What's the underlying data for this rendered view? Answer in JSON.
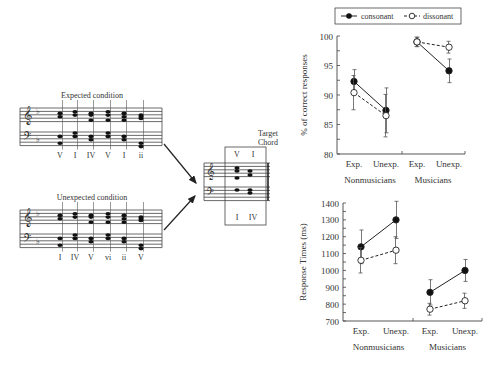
{
  "figure": {
    "expected_title": "Expected condition",
    "unexpected_title": "Unexpected condition",
    "expected_numerals": [
      "V",
      "I",
      "IV",
      "V",
      "I",
      "ii"
    ],
    "unexpected_numerals": [
      "I",
      "IV",
      "V",
      "vi",
      "ii",
      "V"
    ],
    "target_label_line1": "Target",
    "target_label_line2": "Chord",
    "target_top_numerals": [
      "V",
      "I"
    ],
    "target_bottom_numerals": [
      "I",
      "IV"
    ]
  },
  "legend": {
    "consonant": "consonant",
    "dissonant": "dissonant"
  },
  "chart_data": [
    {
      "type": "line",
      "title": "",
      "xlabel": "",
      "ylabel": "% of correct responses",
      "ylim": [
        80,
        100
      ],
      "yticks": [
        "80",
        "85",
        "90",
        "95",
        "100"
      ],
      "categories": [
        "Exp.",
        "Unexp.",
        "Exp.",
        "Unexp."
      ],
      "groups": [
        "Nonmusicians",
        "Musicians"
      ],
      "series": [
        {
          "name": "consonant",
          "values": [
            92.3,
            87.4,
            99.0,
            94.1
          ],
          "errors": [
            2.0,
            3.8,
            0.8,
            2.0
          ],
          "marker": "filled-circle",
          "line": "solid"
        },
        {
          "name": "dissonant",
          "values": [
            90.4,
            86.5,
            99.0,
            98.1
          ],
          "errors": [
            2.9,
            3.6,
            0.8,
            1.0
          ],
          "marker": "open-circle",
          "line": "dashed"
        }
      ],
      "legend_position": "top"
    },
    {
      "type": "line",
      "title": "",
      "xlabel": "",
      "ylabel": "Response Times (ms)",
      "ylim": [
        700,
        1400
      ],
      "yticks": [
        "700",
        "800",
        "900",
        "1000",
        "1100",
        "1200",
        "1300",
        "1400"
      ],
      "categories": [
        "Exp.",
        "Unexp.",
        "Exp.",
        "Unexp."
      ],
      "groups": [
        "Nonmusicians",
        "Musicians"
      ],
      "series": [
        {
          "name": "consonant",
          "values": [
            1140,
            1300,
            870,
            1000
          ],
          "errors": [
            100,
            110,
            75,
            65
          ],
          "marker": "filled-circle",
          "line": "solid"
        },
        {
          "name": "dissonant",
          "values": [
            1060,
            1120,
            770,
            820
          ],
          "errors": [
            75,
            80,
            35,
            45
          ],
          "marker": "open-circle",
          "line": "dashed"
        }
      ]
    }
  ]
}
